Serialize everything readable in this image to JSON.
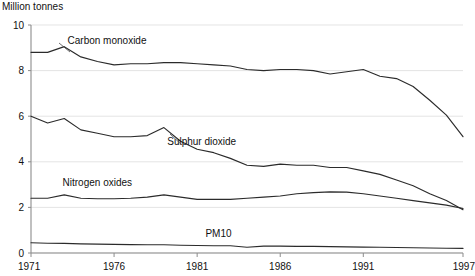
{
  "chart_data": {
    "type": "line",
    "title": "",
    "subtitle": "",
    "ylabel": "Million tonnes",
    "xlabel": "",
    "ylim": [
      0,
      10
    ],
    "xlim": [
      1971,
      1997
    ],
    "ytick_labels": [
      "0",
      "2",
      "4",
      "6",
      "8",
      "10"
    ],
    "yticks": [
      0,
      2,
      4,
      6,
      8,
      10
    ],
    "xtick_labels": [
      "1971",
      "1976",
      "1981",
      "1986",
      "1991",
      "1997"
    ],
    "xticks": [
      1971,
      1976,
      1981,
      1986,
      1991,
      1997
    ],
    "grid": true,
    "legend_position": "inline-annotations",
    "x": [
      1971,
      1972,
      1973,
      1974,
      1975,
      1976,
      1977,
      1978,
      1979,
      1980,
      1981,
      1982,
      1983,
      1984,
      1985,
      1986,
      1987,
      1988,
      1989,
      1990,
      1991,
      1992,
      1993,
      1994,
      1995,
      1996,
      1997
    ],
    "series": [
      {
        "name": "Carbon monoxide",
        "label_x": 1973.2,
        "label_y": 9.15,
        "values": [
          8.8,
          8.8,
          9.05,
          8.6,
          8.4,
          8.25,
          8.3,
          8.3,
          8.35,
          8.35,
          8.3,
          8.25,
          8.2,
          8.05,
          8.0,
          8.05,
          8.05,
          8.0,
          7.85,
          7.95,
          8.05,
          7.75,
          7.65,
          7.3,
          6.7,
          6.05,
          5.1
        ]
      },
      {
        "name": "Sulphur dioxide",
        "label_x": 1979.2,
        "label_y": 4.75,
        "values": [
          6.0,
          5.7,
          5.9,
          5.4,
          5.25,
          5.1,
          5.1,
          5.15,
          5.5,
          4.9,
          4.55,
          4.4,
          4.15,
          3.85,
          3.8,
          3.9,
          3.85,
          3.85,
          3.75,
          3.75,
          3.6,
          3.45,
          3.2,
          2.95,
          2.6,
          2.3,
          1.9
        ]
      },
      {
        "name": "Nitrogen oxides",
        "label_x": 1972.9,
        "label_y": 2.95,
        "values": [
          2.4,
          2.4,
          2.55,
          2.4,
          2.38,
          2.38,
          2.4,
          2.45,
          2.55,
          2.45,
          2.35,
          2.35,
          2.35,
          2.4,
          2.45,
          2.5,
          2.6,
          2.65,
          2.68,
          2.67,
          2.6,
          2.5,
          2.4,
          2.3,
          2.2,
          2.1,
          1.95
        ]
      },
      {
        "name": "PM10",
        "label_x": 1981.5,
        "label_y": 0.72,
        "values": [
          0.45,
          0.43,
          0.42,
          0.4,
          0.39,
          0.38,
          0.37,
          0.36,
          0.36,
          0.34,
          0.33,
          0.32,
          0.32,
          0.25,
          0.3,
          0.3,
          0.29,
          0.29,
          0.28,
          0.27,
          0.26,
          0.25,
          0.24,
          0.23,
          0.22,
          0.21,
          0.2
        ]
      }
    ]
  },
  "colors": {
    "line": "#2b2b2b",
    "grid": "#d9d9d9",
    "axis": "#8c8c8c",
    "text": "#111111",
    "background": "#ffffff"
  }
}
